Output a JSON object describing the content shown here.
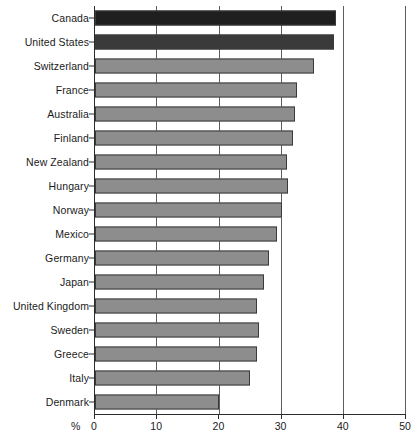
{
  "chart_data": {
    "type": "bar",
    "orientation": "horizontal",
    "title": "",
    "subtitle": "",
    "xlabel": "%",
    "ylabel": "",
    "xlim": [
      0,
      50
    ],
    "xticks": [
      0,
      10,
      20,
      30,
      40,
      50
    ],
    "xtick_labels": [
      "0",
      "10",
      "20",
      "30",
      "40",
      "50"
    ],
    "grid": true,
    "grid_axis": "x",
    "legend": false,
    "legend_position": "none",
    "categories": [
      "Canada",
      "United States",
      "Switzerland",
      "France",
      "Australia",
      "Finland",
      "New Zealand",
      "Hungary",
      "Norway",
      "Mexico",
      "Germany",
      "Japan",
      "United Kingdom",
      "Sweden",
      "Greece",
      "Italy",
      "Denmark"
    ],
    "values": [
      38.8,
      38.5,
      35.2,
      32.4,
      32.2,
      31.8,
      30.8,
      31.0,
      30.0,
      29.2,
      27.9,
      27.1,
      26.1,
      26.3,
      26.1,
      24.9,
      20.0
    ],
    "bar_colors": [
      "#1f1f1f",
      "#3a3a3a",
      "#8d8d8d",
      "#8d8d8d",
      "#8d8d8d",
      "#8d8d8d",
      "#8d8d8d",
      "#8d8d8d",
      "#8d8d8d",
      "#8d8d8d",
      "#8d8d8d",
      "#8d8d8d",
      "#8d8d8d",
      "#8d8d8d",
      "#8d8d8d",
      "#8d8d8d",
      "#8d8d8d"
    ],
    "colors": {
      "highlight_primary": "#1f1f1f",
      "highlight_secondary": "#3a3a3a",
      "default_bar": "#8d8d8d",
      "bar_border": "#3a3a3a",
      "gridline": "#5d5d5d",
      "axis": "#2b2b2b",
      "background": "#ffffff",
      "text": "#1b1b1b"
    }
  }
}
